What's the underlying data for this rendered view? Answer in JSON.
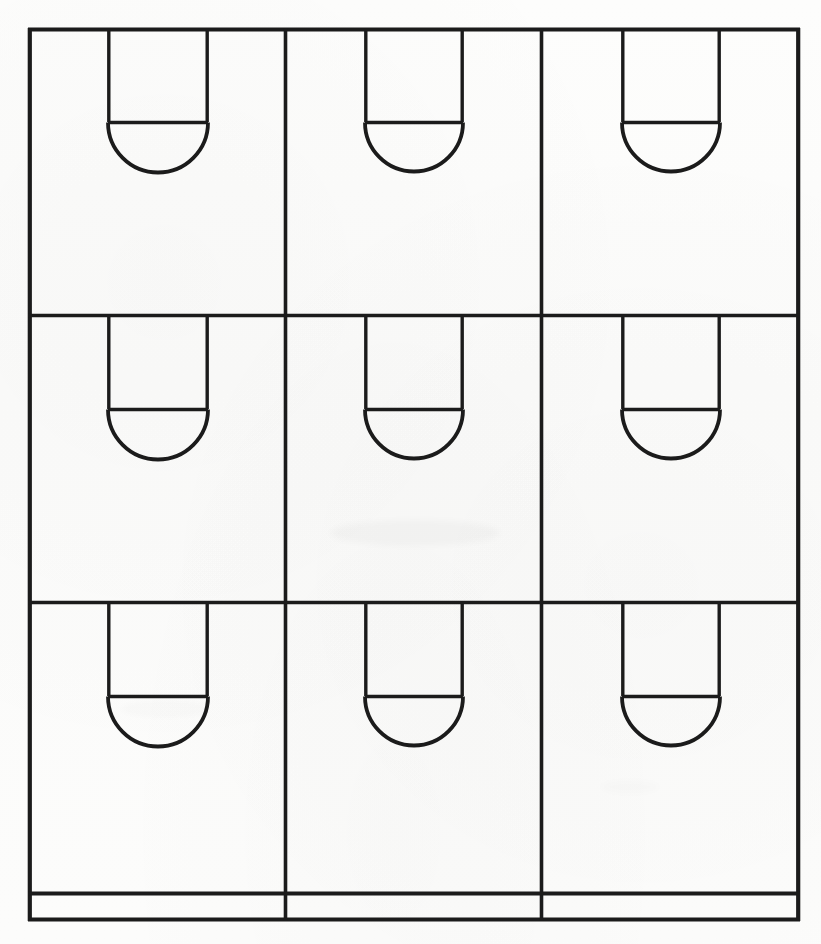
{
  "document": {
    "title": "Basketball Half-Court Key Diagram Grid",
    "kind": "scanned-line-diagram",
    "width": 821,
    "height": 944,
    "background_color": "#fefefe",
    "ink_color": "#1b1b1b"
  },
  "chart_data": {
    "type": "diagram",
    "rows": 3,
    "columns": 3,
    "panel_count": 9,
    "frame": {
      "x": 28,
      "y": 28,
      "width": 772,
      "height": 893
    },
    "vertical_dividers": [
      285,
      541
    ],
    "horizontal_dividers": [
      315,
      602
    ],
    "bottom_strip_line_y": 894,
    "panels": [
      {
        "id": "panel-r1c1",
        "row": 1,
        "column": 1,
        "key_left": 108,
        "key_right": 208,
        "key_top": 30,
        "free_throw_line_y": 122,
        "arc_radius": 50
      },
      {
        "id": "panel-r1c2",
        "row": 1,
        "column": 2,
        "key_left": 365,
        "key_right": 463,
        "key_top": 30,
        "free_throw_line_y": 122,
        "arc_radius": 49
      },
      {
        "id": "panel-r1c3",
        "row": 1,
        "column": 3,
        "key_left": 622,
        "key_right": 720,
        "key_top": 30,
        "free_throw_line_y": 122,
        "arc_radius": 49
      },
      {
        "id": "panel-r2c1",
        "row": 2,
        "column": 1,
        "key_left": 108,
        "key_right": 208,
        "key_top": 317,
        "free_throw_line_y": 409,
        "arc_radius": 50
      },
      {
        "id": "panel-r2c2",
        "row": 2,
        "column": 2,
        "key_left": 365,
        "key_right": 463,
        "key_top": 317,
        "free_throw_line_y": 409,
        "arc_radius": 49
      },
      {
        "id": "panel-r2c3",
        "row": 2,
        "column": 3,
        "key_left": 622,
        "key_right": 720,
        "key_top": 317,
        "free_throw_line_y": 409,
        "arc_radius": 49
      },
      {
        "id": "panel-r3c1",
        "row": 3,
        "column": 1,
        "key_left": 108,
        "key_right": 208,
        "key_top": 604,
        "free_throw_line_y": 696,
        "arc_radius": 50
      },
      {
        "id": "panel-r3c2",
        "row": 3,
        "column": 2,
        "key_left": 365,
        "key_right": 463,
        "key_top": 604,
        "free_throw_line_y": 696,
        "arc_radius": 49
      },
      {
        "id": "panel-r3c3",
        "row": 3,
        "column": 3,
        "key_left": 622,
        "key_right": 720,
        "key_top": 604,
        "free_throw_line_y": 696,
        "arc_radius": 49
      }
    ],
    "labels": [],
    "legend": [],
    "annotations": []
  }
}
